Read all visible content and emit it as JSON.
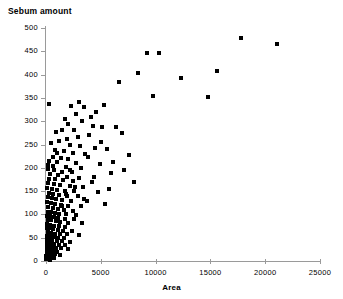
{
  "chart_data": {
    "type": "scatter",
    "title": "Sebum amount",
    "xlabel": "Area",
    "ylabel": "Sebum amount",
    "xlim": [
      0,
      25000
    ],
    "ylim": [
      0,
      500
    ],
    "grid": false,
    "legend": null,
    "marker": "square",
    "marker_color": "#000000",
    "marker_size_px": 4,
    "xticks": [
      0,
      5000,
      10000,
      15000,
      20000,
      25000
    ],
    "xtick_labels": [
      "0",
      "5000",
      "10000",
      "15000",
      "20000",
      "25000"
    ],
    "yticks": [
      0,
      50,
      100,
      150,
      200,
      250,
      300,
      350,
      400,
      450,
      500
    ],
    "ytick_labels": [
      "0",
      "50",
      "100",
      "150",
      "200",
      "250",
      "300",
      "350",
      "400",
      "450",
      "500"
    ],
    "points": [
      [
        250,
        337
      ],
      [
        9200,
        447
      ],
      [
        10300,
        446
      ],
      [
        8400,
        403
      ],
      [
        17800,
        478
      ],
      [
        21100,
        465
      ],
      [
        15600,
        407
      ],
      [
        14800,
        353
      ],
      [
        12300,
        392
      ],
      [
        6700,
        385
      ],
      [
        5300,
        334
      ],
      [
        4600,
        320
      ],
      [
        3000,
        341
      ],
      [
        2300,
        333
      ],
      [
        3500,
        330
      ],
      [
        2700,
        316
      ],
      [
        4100,
        309
      ],
      [
        1700,
        305
      ],
      [
        2000,
        295
      ],
      [
        3300,
        300
      ],
      [
        4300,
        290
      ],
      [
        5100,
        288
      ],
      [
        6400,
        287
      ],
      [
        2600,
        281
      ],
      [
        1500,
        282
      ],
      [
        900,
        276
      ],
      [
        6900,
        274
      ],
      [
        3900,
        270
      ],
      [
        2900,
        266
      ],
      [
        1900,
        262
      ],
      [
        1200,
        258
      ],
      [
        450,
        253
      ],
      [
        2200,
        249
      ],
      [
        3100,
        246
      ],
      [
        4500,
        243
      ],
      [
        5600,
        240
      ],
      [
        800,
        238
      ],
      [
        1600,
        235
      ],
      [
        2500,
        232
      ],
      [
        3600,
        229
      ],
      [
        7600,
        228
      ],
      [
        650,
        224
      ],
      [
        1350,
        221
      ],
      [
        2050,
        218
      ],
      [
        300,
        215
      ],
      [
        1000,
        212
      ],
      [
        2750,
        210
      ],
      [
        4900,
        209
      ],
      [
        150,
        206
      ],
      [
        600,
        204
      ],
      [
        1800,
        201
      ],
      [
        3200,
        199
      ],
      [
        200,
        197
      ],
      [
        750,
        195
      ],
      [
        1450,
        192
      ],
      [
        2350,
        190
      ],
      [
        5900,
        188
      ],
      [
        380,
        186
      ],
      [
        1100,
        184
      ],
      [
        1950,
        181
      ],
      [
        3050,
        179
      ],
      [
        250,
        177
      ],
      [
        820,
        175
      ],
      [
        1550,
        173
      ],
      [
        2450,
        171
      ],
      [
        4200,
        169
      ],
      [
        180,
        167
      ],
      [
        700,
        165
      ],
      [
        1250,
        163
      ],
      [
        2150,
        161
      ],
      [
        3400,
        159
      ],
      [
        130,
        157
      ],
      [
        560,
        155
      ],
      [
        1020,
        153
      ],
      [
        1700,
        151
      ],
      [
        2600,
        150
      ],
      [
        4700,
        148
      ],
      [
        240,
        146
      ],
      [
        680,
        144
      ],
      [
        1150,
        142
      ],
      [
        1880,
        140
      ],
      [
        2900,
        139
      ],
      [
        160,
        137
      ],
      [
        520,
        135
      ],
      [
        940,
        133
      ],
      [
        1420,
        131
      ],
      [
        2250,
        129
      ],
      [
        3700,
        128
      ],
      [
        110,
        126
      ],
      [
        470,
        124
      ],
      [
        860,
        122
      ],
      [
        1330,
        120
      ],
      [
        2000,
        119
      ],
      [
        3150,
        117
      ],
      [
        5400,
        122
      ],
      [
        200,
        115
      ],
      [
        610,
        113
      ],
      [
        1060,
        112
      ],
      [
        1600,
        110
      ],
      [
        2420,
        108
      ],
      [
        140,
        106
      ],
      [
        430,
        105
      ],
      [
        790,
        103
      ],
      [
        1210,
        101
      ],
      [
        1840,
        100
      ],
      [
        2780,
        99
      ],
      [
        95,
        97
      ],
      [
        390,
        96
      ],
      [
        720,
        94
      ],
      [
        1120,
        93
      ],
      [
        1690,
        91
      ],
      [
        2560,
        90
      ],
      [
        170,
        88
      ],
      [
        500,
        87
      ],
      [
        880,
        85
      ],
      [
        1300,
        84
      ],
      [
        1980,
        82
      ],
      [
        3300,
        81
      ],
      [
        120,
        79
      ],
      [
        410,
        78
      ],
      [
        760,
        76
      ],
      [
        1180,
        75
      ],
      [
        1760,
        73
      ],
      [
        85,
        71
      ],
      [
        350,
        70
      ],
      [
        650,
        68
      ],
      [
        1050,
        67
      ],
      [
        1570,
        65
      ],
      [
        2350,
        64
      ],
      [
        150,
        62
      ],
      [
        450,
        61
      ],
      [
        830,
        59
      ],
      [
        1280,
        58
      ],
      [
        1920,
        57
      ],
      [
        3050,
        56
      ],
      [
        100,
        54
      ],
      [
        370,
        53
      ],
      [
        690,
        51
      ],
      [
        1090,
        50
      ],
      [
        1650,
        49
      ],
      [
        70,
        47
      ],
      [
        310,
        46
      ],
      [
        580,
        44
      ],
      [
        960,
        43
      ],
      [
        1440,
        42
      ],
      [
        2150,
        41
      ],
      [
        130,
        39
      ],
      [
        400,
        38
      ],
      [
        740,
        36
      ],
      [
        1150,
        35
      ],
      [
        1720,
        34
      ],
      [
        60,
        32
      ],
      [
        280,
        31
      ],
      [
        520,
        29
      ],
      [
        870,
        28
      ],
      [
        1330,
        27
      ],
      [
        2050,
        26
      ],
      [
        90,
        24
      ],
      [
        340,
        23
      ],
      [
        630,
        21
      ],
      [
        1010,
        20
      ],
      [
        50,
        18
      ],
      [
        240,
        17
      ],
      [
        470,
        15
      ],
      [
        800,
        14
      ],
      [
        1250,
        13
      ],
      [
        40,
        11
      ],
      [
        200,
        10
      ],
      [
        420,
        8
      ],
      [
        700,
        7
      ],
      [
        30,
        5
      ],
      [
        160,
        4
      ],
      [
        350,
        3
      ],
      [
        1450,
        118
      ],
      [
        2200,
        196
      ],
      [
        980,
        231
      ],
      [
        5000,
        256
      ],
      [
        3800,
        224
      ],
      [
        6100,
        213
      ],
      [
        7100,
        196
      ],
      [
        8000,
        170
      ],
      [
        4400,
        181
      ],
      [
        2650,
        158
      ],
      [
        1850,
        144
      ],
      [
        3450,
        134
      ],
      [
        5750,
        154
      ],
      [
        9800,
        355
      ]
    ]
  }
}
